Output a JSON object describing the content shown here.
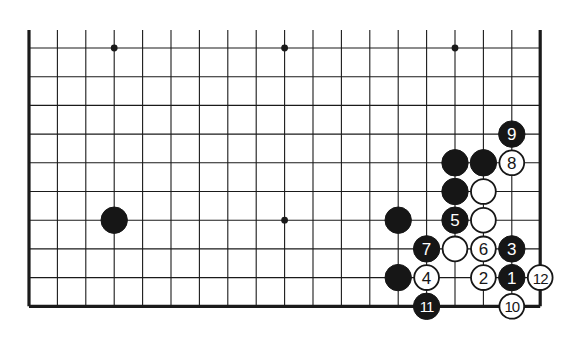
{
  "diagram": {
    "type": "go-board-diagram",
    "board_section": "lower portion, 19 columns visible, 10 rows visible",
    "columns": 19,
    "rows": 10,
    "star_points": [
      [
        3,
        0
      ],
      [
        9,
        0
      ],
      [
        15,
        0
      ],
      [
        9,
        6
      ]
    ],
    "stones": [
      {
        "col": 3,
        "row": 6,
        "color": "black",
        "label": ""
      },
      {
        "col": 13,
        "row": 6,
        "color": "black",
        "label": ""
      },
      {
        "col": 13,
        "row": 8,
        "color": "black",
        "label": ""
      },
      {
        "col": 15,
        "row": 4,
        "color": "black",
        "label": ""
      },
      {
        "col": 16,
        "row": 4,
        "color": "black",
        "label": ""
      },
      {
        "col": 15,
        "row": 5,
        "color": "black",
        "label": ""
      },
      {
        "col": 16,
        "row": 5,
        "color": "white",
        "label": ""
      },
      {
        "col": 16,
        "row": 6,
        "color": "white",
        "label": ""
      },
      {
        "col": 15,
        "row": 7,
        "color": "white",
        "label": ""
      },
      {
        "col": 17,
        "row": 8,
        "color": "black",
        "label": "1"
      },
      {
        "col": 16,
        "row": 8,
        "color": "white",
        "label": "2"
      },
      {
        "col": 17,
        "row": 7,
        "color": "black",
        "label": "3"
      },
      {
        "col": 14,
        "row": 8,
        "color": "white",
        "label": "4"
      },
      {
        "col": 15,
        "row": 6,
        "color": "black",
        "label": "5"
      },
      {
        "col": 16,
        "row": 7,
        "color": "white",
        "label": "6"
      },
      {
        "col": 14,
        "row": 7,
        "color": "black",
        "label": "7"
      },
      {
        "col": 17,
        "row": 4,
        "color": "white",
        "label": "8"
      },
      {
        "col": 17,
        "row": 3,
        "color": "black",
        "label": "9"
      },
      {
        "col": 17,
        "row": 9,
        "color": "white",
        "label": "10"
      },
      {
        "col": 14,
        "row": 9,
        "color": "black",
        "label": "11"
      },
      {
        "col": 18,
        "row": 8,
        "color": "white",
        "label": "12"
      }
    ]
  }
}
